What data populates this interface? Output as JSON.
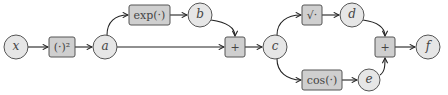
{
  "diagram": {
    "type": "computational-graph",
    "nodes": [
      {
        "id": "x",
        "kind": "variable",
        "label": "x"
      },
      {
        "id": "sq",
        "kind": "operation",
        "label": "(·)²"
      },
      {
        "id": "a",
        "kind": "variable",
        "label": "a"
      },
      {
        "id": "exp",
        "kind": "operation",
        "label": "exp(·)"
      },
      {
        "id": "b",
        "kind": "variable",
        "label": "b"
      },
      {
        "id": "plus1",
        "kind": "operation",
        "label": "+"
      },
      {
        "id": "c",
        "kind": "variable",
        "label": "c"
      },
      {
        "id": "sqrt",
        "kind": "operation",
        "label": "√·"
      },
      {
        "id": "d",
        "kind": "variable",
        "label": "d"
      },
      {
        "id": "cos",
        "kind": "operation",
        "label": "cos(·)"
      },
      {
        "id": "e",
        "kind": "variable",
        "label": "e"
      },
      {
        "id": "plus2",
        "kind": "operation",
        "label": "+"
      },
      {
        "id": "f",
        "kind": "variable",
        "label": "f"
      }
    ],
    "edges": [
      [
        "x",
        "sq"
      ],
      [
        "sq",
        "a"
      ],
      [
        "a",
        "exp"
      ],
      [
        "exp",
        "b"
      ],
      [
        "a",
        "plus1"
      ],
      [
        "b",
        "plus1"
      ],
      [
        "plus1",
        "c"
      ],
      [
        "c",
        "sqrt"
      ],
      [
        "sqrt",
        "d"
      ],
      [
        "c",
        "cos"
      ],
      [
        "cos",
        "e"
      ],
      [
        "d",
        "plus2"
      ],
      [
        "e",
        "plus2"
      ],
      [
        "plus2",
        "f"
      ]
    ],
    "colors": {
      "variable_fill": "#e6e6e6",
      "operation_fill": "#cfcfcf",
      "stroke": "#555555",
      "edge": "#222222"
    }
  },
  "labels": {
    "x": "x",
    "sq": "(·)²",
    "a": "a",
    "exp": "exp(·)",
    "b": "b",
    "plus1": "+",
    "c": "c",
    "sqrt": "√·",
    "d": "d",
    "cos": "cos(·)",
    "e": "e",
    "plus2": "+",
    "f": "f"
  }
}
